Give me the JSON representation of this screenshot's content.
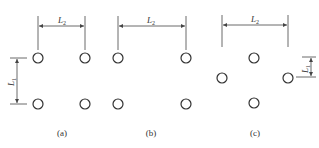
{
  "diagrams": [
    {
      "id": "a",
      "caption": "(a)",
      "layout": "square 2x2 grid",
      "holes": [
        [
          38,
          58
        ],
        [
          85,
          58
        ],
        [
          38,
          104
        ],
        [
          85,
          104
        ]
      ],
      "dimensions": [
        {
          "label": "L",
          "subscript": "2",
          "orientation": "horizontal"
        },
        {
          "label": "L",
          "subscript": "1",
          "orientation": "vertical"
        }
      ]
    },
    {
      "id": "b",
      "caption": "(b)",
      "layout": "rectangular 2x2 grid",
      "holes": [
        [
          118,
          58
        ],
        [
          186,
          58
        ],
        [
          118,
          104
        ],
        [
          186,
          104
        ]
      ],
      "dimensions": [
        {
          "label": "L",
          "subscript": "2",
          "orientation": "horizontal"
        }
      ]
    },
    {
      "id": "c",
      "caption": "(c)",
      "layout": "staggered diamond",
      "holes": [
        [
          254,
          58
        ],
        [
          222,
          78
        ],
        [
          288,
          78
        ],
        [
          254,
          103
        ]
      ],
      "dimensions": [
        {
          "label": "L",
          "subscript": "2",
          "orientation": "horizontal"
        },
        {
          "label": "L",
          "subscript": "1",
          "orientation": "vertical"
        }
      ]
    }
  ],
  "colors": {
    "stroke": "#333333",
    "background": "#ffffff"
  }
}
